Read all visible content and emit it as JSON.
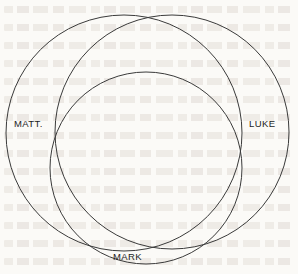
{
  "page": {
    "background_color": "#fbfaf7",
    "width": 298,
    "height": 274
  },
  "diagram": {
    "type": "venn-diagram",
    "stroke_color": "#3a3a3a",
    "stroke_width": 1,
    "fill": "none",
    "circles": [
      {
        "id": "matthew",
        "label": "MATT.",
        "cx": 124,
        "cy": 133,
        "r": 118
      },
      {
        "id": "luke",
        "label": "LUKE",
        "cx": 172,
        "cy": 132,
        "r": 117
      },
      {
        "id": "mark",
        "label": "MARK",
        "cx": 146,
        "cy": 168,
        "r": 96
      }
    ],
    "labels": {
      "matthew": "MATT.",
      "luke": "LUKE",
      "mark": "MARK"
    }
  },
  "background_text": {
    "description": "faint illegible show-through text from the reverse side of the page",
    "color": "#b0a193",
    "legible": false
  }
}
